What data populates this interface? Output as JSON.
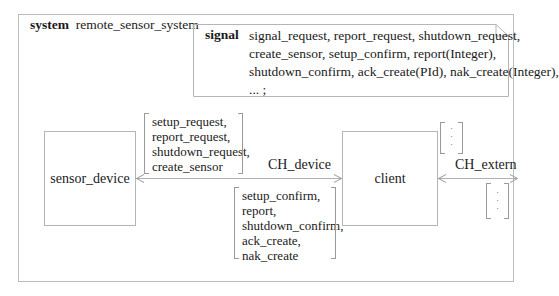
{
  "system": {
    "keyword": "system",
    "name": "remote_sensor_system"
  },
  "signal_note": {
    "keyword": "signal",
    "lines": [
      "signal_request, report_request, shutdown_request,",
      "create_sensor, setup_confirm, report(Integer),",
      "shutdown_confirm, ack_create(PId), nak_create(Integer),",
      "... ;"
    ]
  },
  "blocks": {
    "sensor_device": "sensor_device",
    "client": "client"
  },
  "channels": {
    "ch_device": {
      "label": "CH_device",
      "to_sensor_signals": [
        "setup_request,",
        "report_request,",
        "shutdown_request,",
        "create_sensor"
      ],
      "to_client_signals": [
        "setup_confirm,",
        "report,",
        "shutdown_confirm,",
        "ack_create,",
        "nak_create"
      ]
    },
    "ch_extern": {
      "label": "CH_extern",
      "upper_signals": "·\n·\n·",
      "lower_signals": "·\n·\n·"
    }
  },
  "colors": {
    "line": "#b0b0b0",
    "text": "#1a1a1a",
    "background": "#ffffff"
  }
}
